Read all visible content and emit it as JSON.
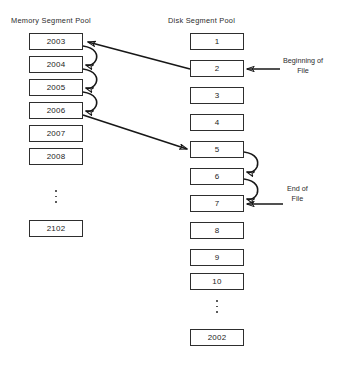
{
  "diagram": {
    "columns": {
      "memory": {
        "title": "Memory Segment Pool",
        "segments": [
          "2003",
          "2004",
          "2005",
          "2006",
          "2007",
          "2008"
        ],
        "ellipsis": "vertical-ellipsis",
        "tail_segment": "2102"
      },
      "disk": {
        "title": "Disk Segment Pool",
        "segments": [
          "1",
          "2",
          "3",
          "4",
          "5",
          "6",
          "7",
          "8",
          "9",
          "10"
        ],
        "ellipsis": "vertical-ellipsis",
        "tail_segment": "2002"
      }
    },
    "annotations": [
      {
        "id": "beginning-of-file",
        "line1": "Beginning of",
        "line2": "File",
        "target": "2"
      },
      {
        "id": "end-of-file",
        "line1": "End of",
        "line2": "File",
        "target": "7"
      }
    ],
    "links": {
      "memory_chain": [
        "2003-2004",
        "2004-2005",
        "2005-2006"
      ],
      "disk_chain": [
        "5-6",
        "6-7"
      ],
      "cross_links": [
        "2-2003",
        "2006-5"
      ]
    },
    "colors": {
      "stroke": "#171717",
      "box_border": "#2e2e2e",
      "text": "#1c1c1c",
      "background": "#ffffff"
    }
  }
}
